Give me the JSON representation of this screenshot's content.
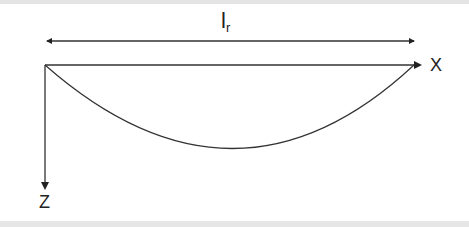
{
  "diagram": {
    "dimension_label": {
      "main": "l",
      "subscript": "r"
    },
    "x_axis_label": "X",
    "z_axis_label": "Z",
    "colors": {
      "line": "#333333",
      "background": "#ffffff",
      "band": "#e4e4e4"
    },
    "elements": [
      "double-headed dimension arrow spanning length l_r",
      "horizontal X axis with arrow",
      "vertical Z axis pointing downward",
      "sagging curve (catenary/parabola) between supports"
    ]
  }
}
